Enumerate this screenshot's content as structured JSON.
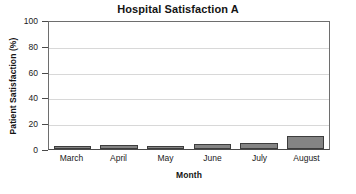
{
  "chart_data": {
    "type": "bar",
    "title": "Hospital Satisfaction A",
    "xlabel": "Month",
    "ylabel": "Patient Satisfaction (%)",
    "categories": [
      "March",
      "April",
      "May",
      "June",
      "July",
      "August"
    ],
    "values": [
      2,
      3,
      2,
      4,
      5,
      10
    ],
    "ylim": [
      0,
      100
    ],
    "yticks": [
      0,
      20,
      40,
      60,
      80,
      100
    ],
    "ytick_labels": [
      "0",
      "20",
      "40",
      "60",
      "80",
      "100"
    ],
    "grid": true,
    "legend": "none",
    "bar_color": "#848484",
    "bar_edge_color": "#3d3d3d",
    "gridline_color": "#d8d8d8",
    "axis_color": "#4a4a4a",
    "background": "#ffffff"
  }
}
